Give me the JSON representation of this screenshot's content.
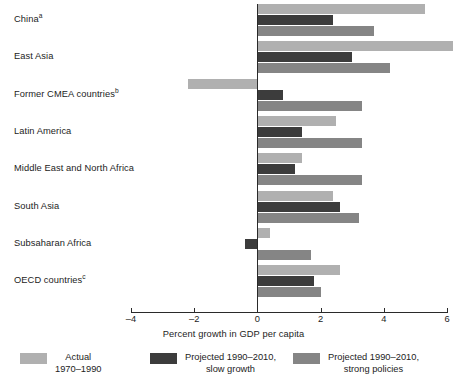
{
  "chart_data": {
    "type": "bar",
    "orientation": "horizontal",
    "title": "",
    "xlabel": "Percent growth in GDP per capita",
    "ylabel": "",
    "xlim": [
      -4,
      6
    ],
    "xticks": [
      -4,
      -2,
      0,
      2,
      4,
      6
    ],
    "xtick_labels": [
      "–4",
      "–2",
      "0",
      "2",
      "4",
      "6"
    ],
    "grid": false,
    "legend_position": "bottom",
    "categories": [
      "China",
      "East Asia",
      "Former CMEA countries",
      "Latin America",
      "Middle East and North Africa",
      "South Asia",
      "Subsaharan Africa",
      "OECD countries"
    ],
    "category_footnotes": [
      "a",
      "",
      "b",
      "",
      "",
      "",
      "",
      "c"
    ],
    "series": [
      {
        "name": "Actual 1970–1990",
        "color": "#b0b0b0",
        "values": [
          5.3,
          6.2,
          -2.2,
          2.5,
          1.4,
          2.4,
          0.4,
          2.6
        ]
      },
      {
        "name": "Projected 1990–2010, slow growth",
        "color": "#3c3c3c",
        "values": [
          2.4,
          3.0,
          0.8,
          1.4,
          1.2,
          2.6,
          -0.4,
          1.8
        ]
      },
      {
        "name": "Projected 1990–2010, strong policies",
        "color": "#858585",
        "values": [
          3.7,
          4.2,
          3.3,
          3.3,
          3.3,
          3.2,
          1.7,
          2.0
        ]
      }
    ]
  },
  "legend": {
    "items": [
      {
        "line1": "Actual",
        "line2": "1970–1990",
        "swatch": "actual"
      },
      {
        "line1": "Projected 1990–2010,",
        "line2": "slow growth",
        "swatch": "slow"
      },
      {
        "line1": "Projected 1990–2010,",
        "line2": "strong policies",
        "swatch": "strong"
      }
    ]
  },
  "axis": {
    "title": "Percent growth in GDP per capita"
  },
  "colors": {
    "actual": "#b0b0b0",
    "slow": "#3c3c3c",
    "strong": "#858585",
    "axis": "#2a2a2a",
    "background": "#ffffff"
  }
}
